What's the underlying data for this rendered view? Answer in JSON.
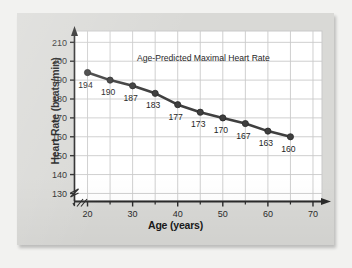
{
  "figure": {
    "background_color": "#d9d9d6",
    "plot_background_color": "#ffffff",
    "grid_color": "#c9c9c9",
    "axis_color": "#2b2b2b",
    "series_color": "#3f3f3f"
  },
  "chart_data": {
    "type": "line",
    "title": "",
    "annotation": "Age-Predicted Maximal Heart Rate",
    "xlabel": "Age (years)",
    "ylabel": "Heart Rate (beats/min)",
    "x": [
      20,
      25,
      30,
      35,
      40,
      45,
      50,
      55,
      60,
      65
    ],
    "values": [
      194,
      190,
      187,
      183,
      177,
      173,
      170,
      167,
      163,
      160
    ],
    "point_labels": [
      "194",
      "190",
      "187",
      "183",
      "177",
      "173",
      "170",
      "167",
      "163",
      "160"
    ],
    "xlim": [
      17,
      72
    ],
    "ylim": [
      126,
      216
    ],
    "xticks": [
      20,
      30,
      40,
      50,
      60,
      70
    ],
    "xtick_labels": [
      "20",
      "30",
      "40",
      "50",
      "60",
      "70"
    ],
    "x_minor_ticks": [
      25,
      35,
      45,
      55,
      65
    ],
    "yticks": [
      130,
      140,
      150,
      160,
      170,
      180,
      190,
      200,
      210
    ],
    "ytick_labels": [
      "130",
      "140",
      "150",
      "160",
      "170",
      "180",
      "190",
      "200",
      "210"
    ],
    "grid": true,
    "legend": "none",
    "y_axis_break": true,
    "x_axis_arrow": true,
    "y_axis_arrow": true,
    "marker": "circle"
  }
}
